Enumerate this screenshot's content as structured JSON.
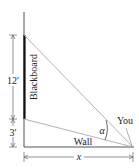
{
  "diagram": {
    "labels": {
      "blackboard": "Blackboard",
      "height_board": "12′",
      "height_base": "3′",
      "wall": "Wall",
      "viewer": "You",
      "angle": "α",
      "distance": "x"
    },
    "colors": {
      "line": "#555555",
      "sight_line": "#aaaaaa",
      "board": "#111111",
      "text": "#222222"
    }
  }
}
